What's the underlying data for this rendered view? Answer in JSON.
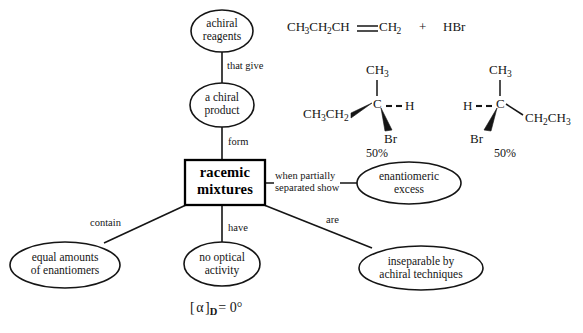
{
  "diagram": {
    "stroke_color": "#151515",
    "background": "#ffffff",
    "nodes": {
      "achiral_reagents": {
        "line1": "achiral",
        "line2": "reagents"
      },
      "chiral_product": {
        "line1": "a chiral",
        "line2": "product"
      },
      "racemic_box": {
        "line1": "racemic",
        "line2": "mixtures"
      },
      "enantiomeric_excess": {
        "line1": "enantiomeric",
        "line2": "excess"
      },
      "equal_amounts": {
        "line1": "equal amounts",
        "line2": "of enantiomers"
      },
      "no_optical_activity": {
        "line1": "no optical",
        "line2": "activity"
      },
      "inseparable": {
        "line1": "inseparable by",
        "line2": "achiral techniques"
      }
    },
    "edge_labels": {
      "that_give": "that give",
      "form": "form",
      "when_partially_separated_show_line1": "when partially",
      "when_partially_separated_show_line2": "separated show",
      "contain": "contain",
      "have": "have",
      "are": "are"
    },
    "annotation": {
      "rotation_bracket_open": "[",
      "rotation_alpha": "α",
      "rotation_bracket_close": "]",
      "rotation_subscript": "D",
      "rotation_value": "= 0°"
    }
  },
  "chemistry": {
    "reaction": {
      "substrate_part1": "CH",
      "substrate_sub1": "3",
      "substrate_part2": "CH",
      "substrate_sub2": "2",
      "substrate_part3": "CH",
      "substrate_part4": "CH",
      "substrate_sub3": "2",
      "plus": "+",
      "reagent": "HBr",
      "full_formula": "CH3CH2CH=CH2 + HBr",
      "bond_type": "double"
    },
    "enantiomer_left": {
      "top_label": "CH",
      "top_sub": "3",
      "center_atom": "C",
      "left_label_a": "CH",
      "left_sub_a": "3",
      "left_label_b": "CH",
      "left_sub_b": "2",
      "right_label": "H",
      "bottom_label": "Br",
      "yield": "50%",
      "bond_left": "wedge",
      "bond_right": "dashed",
      "bond_bottom": "wedge",
      "bond_top": "plain"
    },
    "enantiomer_right": {
      "top_label": "CH",
      "top_sub": "3",
      "center_atom": "C",
      "left_label": "H",
      "right_label_a": "CH",
      "right_sub_a": "2",
      "right_label_b": "CH",
      "right_sub_b": "3",
      "bottom_label": "Br",
      "yield": "50%",
      "bond_left": "dashed",
      "bond_right": "plain",
      "bond_bottom": "wedge",
      "bond_top": "plain"
    }
  }
}
